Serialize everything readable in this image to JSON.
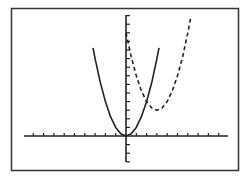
{
  "chart_data": {
    "type": "line",
    "title": "",
    "xlabel": "",
    "ylabel": "",
    "xlim": [
      -10,
      10
    ],
    "ylim": [
      -3,
      14
    ],
    "x_tick_step": 1,
    "y_tick_step": 1,
    "grid": false,
    "legend": null,
    "series": [
      {
        "name": "solid parabola",
        "style": "solid",
        "equation": "y = x^2",
        "vertex": [
          0,
          0
        ],
        "x": [
          -3.2,
          -3,
          -2.5,
          -2,
          -1.5,
          -1,
          -0.5,
          0,
          0.5,
          1,
          1.5,
          2,
          2.5,
          3,
          3.2
        ],
        "y": [
          10.24,
          9,
          6.25,
          4,
          2.25,
          1,
          0.25,
          0,
          0.25,
          1,
          2.25,
          4,
          6.25,
          9,
          10.24
        ]
      },
      {
        "name": "dashed parabola",
        "style": "dashed",
        "equation": "y = (x-3)^2 + 3",
        "vertex": [
          3,
          3
        ],
        "x": [
          0,
          0.5,
          1,
          1.5,
          2,
          2.5,
          3,
          3.5,
          4,
          4.5,
          5,
          5.5,
          6,
          6.3
        ],
        "y": [
          12,
          9.25,
          7,
          5.25,
          4,
          3.25,
          3,
          3.25,
          4,
          5.25,
          7,
          9.25,
          12,
          13.9
        ]
      }
    ]
  },
  "style": {
    "frame_color": "#333333",
    "axis_color": "#222222",
    "curve_color": "#222222",
    "background": "#ffffff"
  }
}
